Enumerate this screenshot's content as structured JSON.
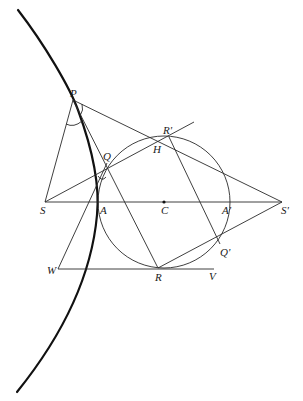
{
  "figure": {
    "type": "geometric-construction",
    "colors": {
      "stroke": "#2a2a2a",
      "curve": "#111111",
      "background": "#ffffff"
    }
  },
  "labels": {
    "P": "P",
    "Q": "Q",
    "R_prime": "R'",
    "H": "H",
    "S": "S",
    "A": "A",
    "C": "C",
    "A_prime": "A'",
    "S_prime": "S'",
    "Q_prime": "Q'",
    "W": "W",
    "R": "R",
    "V": "V"
  },
  "points": {
    "P": [
      73,
      100
    ],
    "Q": [
      107,
      163
    ],
    "R_prime": [
      169,
      137
    ],
    "H": [
      157,
      142
    ],
    "S": [
      45,
      202
    ],
    "A": [
      98,
      202
    ],
    "C": [
      164,
      202
    ],
    "A_prime": [
      230,
      202
    ],
    "S_prime": [
      282,
      202
    ],
    "Q_prime": [
      220,
      244
    ],
    "W": [
      58,
      269
    ],
    "R": [
      158,
      268
    ],
    "V": [
      214,
      269
    ]
  },
  "circle": {
    "center": "C",
    "radius": 66
  }
}
